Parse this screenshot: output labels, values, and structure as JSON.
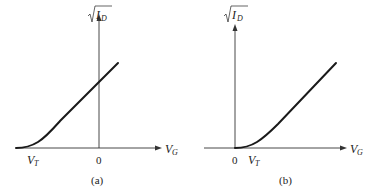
{
  "panels": [
    {
      "id": "a",
      "caption": "(a)",
      "y_axis_label": "I",
      "y_axis_sub": "D",
      "x_axis_label": "V",
      "x_axis_sub": "G",
      "threshold_label": "V",
      "threshold_sub": "T",
      "origin_label": "0",
      "description": "Depletion-mode: threshold voltage V_T is negative (left of origin)"
    },
    {
      "id": "b",
      "caption": "(b)",
      "y_axis_label": "I",
      "y_axis_sub": "D",
      "x_axis_label": "V",
      "x_axis_sub": "G",
      "threshold_label": "V",
      "threshold_sub": "T",
      "origin_label": "0",
      "description": "Enhancement-mode: threshold voltage V_T is positive (right of origin)"
    }
  ]
}
